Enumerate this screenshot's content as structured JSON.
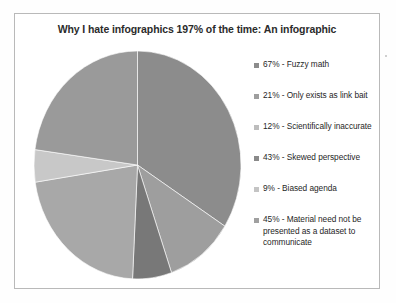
{
  "chart_data": {
    "type": "pie",
    "title": "Why I hate infographics 197% of the time: An infographic",
    "categories": [
      "Fuzzy math",
      "Only exists as link bait",
      "Scientifically inaccurate",
      "Skewed perspective",
      "Biased agenda",
      "Material need not be presented as a dataset to communicate"
    ],
    "values": [
      67,
      21,
      12,
      43,
      9,
      45
    ],
    "value_unit": "%",
    "total": 197,
    "start_angle_deg": 0,
    "direction": "clockwise",
    "legend_position": "right",
    "grid": false,
    "slice_colors": [
      "#8c8c8c",
      "#9e9e9e",
      "#787878",
      "#a8a8a8",
      "#c8c8c8",
      "#9a9a9a"
    ],
    "legend_entries": [
      {
        "marker_color": "#8c8c8c",
        "label": "67% - Fuzzy math"
      },
      {
        "marker_color": "#9e9e9e",
        "label": "21% - Only exists as link bait"
      },
      {
        "marker_color": "#bdbdbd",
        "label": "12%  - Scientifically inaccurate"
      },
      {
        "marker_color": "#8a8a8a",
        "label": "43% - Skewed perspective"
      },
      {
        "marker_color": "#c4c4c4",
        "label": "9% - Biased agenda"
      },
      {
        "marker_color": "#a0a0a0",
        "label": "45% - Material need not be presented as a dataset to communicate"
      }
    ]
  },
  "frame": {
    "border_color": "#b9b9b9",
    "background": "#ffffff"
  }
}
